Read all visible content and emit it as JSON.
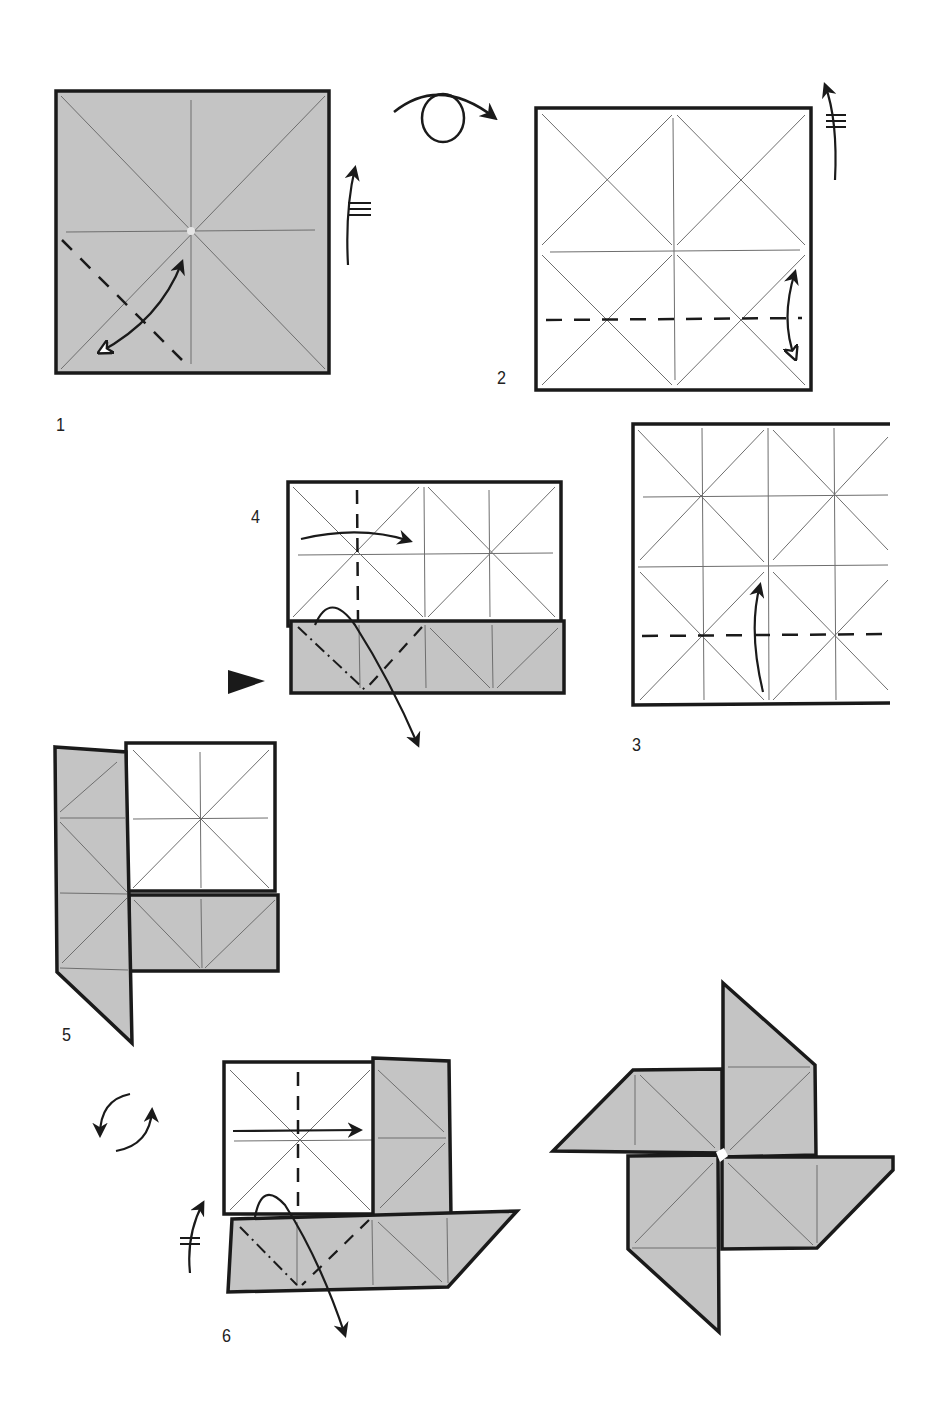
{
  "colors": {
    "paper_back": "#c4c4c4",
    "paper_front": "#ffffff",
    "edge": "#1a1a1a",
    "crease": "#6e6e6e"
  },
  "steps": [
    {
      "id": "step-1",
      "label": "1",
      "instructions": [
        "valley fold corner to center and unfold",
        "crease marks",
        "turn over indicator arrow"
      ]
    },
    {
      "id": "step-2",
      "label": "2",
      "instructions": [
        "turn paper over",
        "valley fold bottom edge to center and unfold"
      ]
    },
    {
      "id": "step-3",
      "label": "3",
      "instructions": [
        "valley fold bottom edge up to center line"
      ]
    },
    {
      "id": "step-4",
      "label": "4",
      "instructions": [
        "valley fold left edge to center",
        "squash fold bottom-left flap",
        "view direction arrow"
      ]
    },
    {
      "id": "step-5",
      "label": "5",
      "instructions": [
        "result after step 4"
      ]
    },
    {
      "id": "step-6",
      "label": "6",
      "instructions": [
        "rotate paper",
        "valley fold left side to center",
        "squash fold bottom flap"
      ]
    },
    {
      "id": "final",
      "label": "",
      "instructions": [
        "finished pinwheel"
      ]
    }
  ]
}
